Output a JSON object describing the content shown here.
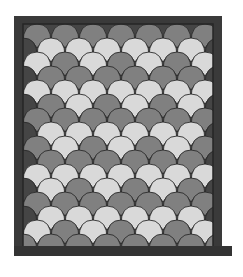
{
  "image": {
    "subject": "clamshell quilt",
    "colors": {
      "background": "#ffffff",
      "frame": "#3a3a3a",
      "frame_inner": "#2e2e2e",
      "outline": "#2a2a2a",
      "light": "#d9d9d9",
      "medium": "#808080",
      "dark": "#454545"
    },
    "frame": {
      "x": 14,
      "y": 16,
      "w": 208,
      "h": 240,
      "border": 9,
      "base_x": 14,
      "base_w": 218,
      "base_y": 246,
      "base_h": 10
    },
    "scale": {
      "w": 28,
      "h": 18,
      "row_step": 14,
      "origin_x": 23,
      "origin_y": 24
    },
    "rows": [
      "MMMMMMMM",
      "DLLLLLLD",
      "LMLMLML",
      "DMMMMMMD",
      "LLLLLLLL",
      "DMLMLMLD",
      "MMMMMMMM",
      "DLLLLLLD",
      "MLMLMLML",
      "DMMMMMMD",
      "LLLLLLLL",
      "DLMLMLMD",
      "MMMMMMMM",
      "DLLLLLLD",
      "LMLMLMLM",
      "MMMMMMMM",
      "DDDDDDDD"
    ]
  }
}
